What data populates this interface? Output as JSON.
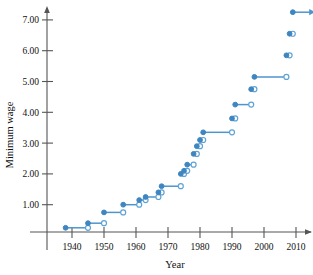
{
  "chart_data": {
    "type": "line",
    "subtype": "step-function",
    "title": "",
    "xlabel": "Year",
    "ylabel": "Minimum wage",
    "xlim": [
      1933,
      2017
    ],
    "ylim": [
      0,
      7.6
    ],
    "grid": false,
    "legend": null,
    "x_ticks": [
      1940,
      1950,
      1960,
      1970,
      1980,
      1990,
      2000,
      2010
    ],
    "x_tick_labels": [
      "1940",
      "1950",
      "1960",
      "1970",
      "1980",
      "1990",
      "2000",
      "2010"
    ],
    "y_ticks": [
      1.0,
      2.0,
      3.0,
      4.0,
      5.0,
      6.0,
      7.0
    ],
    "y_tick_labels": [
      "1.00",
      "2.00",
      "3.00",
      "4.00",
      "5.00",
      "6.00",
      "7.00"
    ],
    "marker_closed": "filled-circle-left-endpoint",
    "marker_open": "open-circle-right-endpoint",
    "series_color": "#4f95cd",
    "final_segment_arrow": true,
    "steps": [
      {
        "start": 1938,
        "end": 1945,
        "value": 0.25
      },
      {
        "start": 1945,
        "end": 1950,
        "value": 0.4
      },
      {
        "start": 1950,
        "end": 1956,
        "value": 0.75
      },
      {
        "start": 1956,
        "end": 1961,
        "value": 1.0
      },
      {
        "start": 1961,
        "end": 1963,
        "value": 1.15
      },
      {
        "start": 1963,
        "end": 1967,
        "value": 1.25
      },
      {
        "start": 1967,
        "end": 1968,
        "value": 1.4
      },
      {
        "start": 1968,
        "end": 1974,
        "value": 1.6
      },
      {
        "start": 1974,
        "end": 1975,
        "value": 2.0
      },
      {
        "start": 1975,
        "end": 1976,
        "value": 2.1
      },
      {
        "start": 1976,
        "end": 1978,
        "value": 2.3
      },
      {
        "start": 1978,
        "end": 1979,
        "value": 2.65
      },
      {
        "start": 1979,
        "end": 1980,
        "value": 2.9
      },
      {
        "start": 1980,
        "end": 1981,
        "value": 3.1
      },
      {
        "start": 1981,
        "end": 1990,
        "value": 3.35
      },
      {
        "start": 1990,
        "end": 1991,
        "value": 3.8
      },
      {
        "start": 1991,
        "end": 1996,
        "value": 4.25
      },
      {
        "start": 1996,
        "end": 1997,
        "value": 4.75
      },
      {
        "start": 1997,
        "end": 2007,
        "value": 5.15
      },
      {
        "start": 2007,
        "end": 2008,
        "value": 5.85
      },
      {
        "start": 2008,
        "end": 2009,
        "value": 6.55
      },
      {
        "start": 2009,
        "end": 2016,
        "value": 7.25
      }
    ]
  },
  "axes": {
    "y_axis_title": "Minimum wage",
    "x_axis_title": "Year"
  }
}
